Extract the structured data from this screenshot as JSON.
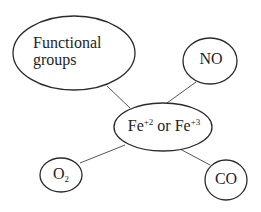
{
  "diagram": {
    "center_node": {
      "label_prefix": "Fe",
      "label_sup1": "+2",
      "label_mid": " or Fe",
      "label_sup2": "+3"
    },
    "nodes": {
      "functional_groups": {
        "line1": "Functional",
        "line2": "groups"
      },
      "no": {
        "label": "NO"
      },
      "o2": {
        "label_base": "O",
        "label_sub": "2"
      },
      "co": {
        "label": "CO"
      }
    },
    "edges": [
      {
        "from": "Functional groups",
        "to": "Fe+2 or Fe+3"
      },
      {
        "from": "NO",
        "to": "Fe+2 or Fe+3"
      },
      {
        "from": "O2",
        "to": "Fe+2 or Fe+3"
      },
      {
        "from": "CO",
        "to": "Fe+2 or Fe+3"
      }
    ],
    "colors": {
      "stroke": "#2b2b2b",
      "edge": "#555555",
      "text": "#1e1e1e",
      "background": "#ffffff"
    }
  }
}
